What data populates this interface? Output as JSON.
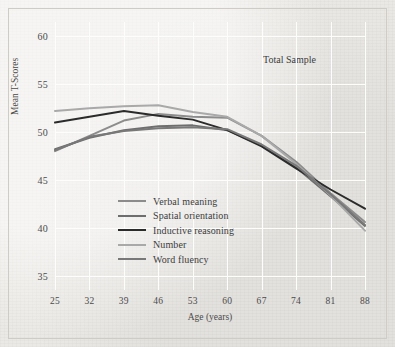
{
  "figure": {
    "annotation": "Total Sample",
    "background_color": "#ebe9e5",
    "gridline_color": "#fdfdfc"
  },
  "chart_data": {
    "type": "line",
    "title": "",
    "annotation": "Total Sample",
    "xlabel": "Age (years)",
    "ylabel": "Mean T-Scores",
    "x": [
      25,
      32,
      39,
      46,
      53,
      60,
      67,
      74,
      81,
      88
    ],
    "xticklabels": [
      "25",
      "32",
      "39",
      "46",
      "53",
      "60",
      "67",
      "74",
      "81",
      "88"
    ],
    "yticklabels": [
      "35",
      "40",
      "45",
      "50",
      "55",
      "60"
    ],
    "yticks": [
      35,
      40,
      45,
      50,
      55,
      60
    ],
    "xlim": [
      25,
      88
    ],
    "ylim": [
      33.5,
      61.5
    ],
    "grid": true,
    "legend_position": "center-left-inside",
    "series": [
      {
        "name": "Verbal meaning",
        "color": "#8c8c8c",
        "values": [
          48.0,
          49.6,
          51.2,
          51.9,
          51.6,
          51.5,
          49.6,
          46.9,
          43.6,
          40.6
        ]
      },
      {
        "name": "Spatial orientation",
        "color": "#6e6e6e",
        "values": [
          48.2,
          49.4,
          50.2,
          50.6,
          50.7,
          50.2,
          48.6,
          46.3,
          43.3,
          40.2
        ]
      },
      {
        "name": "Inductive reasoning",
        "color": "#2b2b2b",
        "values": [
          51.0,
          51.6,
          52.2,
          51.7,
          51.3,
          50.2,
          48.5,
          46.2,
          44.0,
          42.0
        ]
      },
      {
        "name": "Number",
        "color": "#a9a9a9",
        "values": [
          52.2,
          52.5,
          52.7,
          52.8,
          52.1,
          51.6,
          49.6,
          46.7,
          43.4,
          39.7
        ]
      },
      {
        "name": "Word fluency",
        "color": "#787878",
        "values": [
          48.1,
          49.5,
          50.1,
          50.4,
          50.5,
          50.3,
          48.7,
          46.5,
          43.5,
          40.3
        ]
      }
    ]
  }
}
